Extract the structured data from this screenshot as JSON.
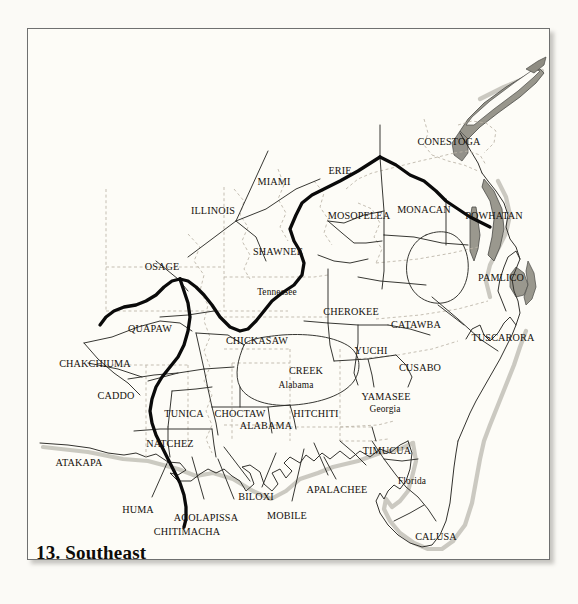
{
  "figure": {
    "title": "13. Southeast",
    "background_color": "#fdfcf7",
    "frame_color": "#6f7070",
    "text_color": "#15110c"
  },
  "map": {
    "region": "Southeast",
    "line_styles": {
      "culture_area_boundary": {
        "color": "#0a0a0a",
        "width": 3.2,
        "dash": "none"
      },
      "tribal_boundary": {
        "color": "#2b2b2b",
        "width": 0.9,
        "dash": "none"
      },
      "state_boundary": {
        "color": "#b9b2a4",
        "width": 0.8,
        "dash": "3,2.5"
      },
      "coastline": {
        "color": "#3a3a36",
        "width": 0.9
      },
      "coast_shadow": {
        "color": "#9a978c",
        "opacity": 0.55
      }
    },
    "tribe_labels": [
      {
        "name": "CONESTOGA",
        "x": 421,
        "y": 113
      },
      {
        "name": "ERIE",
        "x": 312,
        "y": 142
      },
      {
        "name": "MIAMI",
        "x": 246,
        "y": 153
      },
      {
        "name": "ILLINOIS",
        "x": 185,
        "y": 182
      },
      {
        "name": "MOSOPELEA",
        "x": 331,
        "y": 187
      },
      {
        "name": "MONACAN",
        "x": 396,
        "y": 181
      },
      {
        "name": "POWHATAN",
        "x": 466,
        "y": 187
      },
      {
        "name": "SHAWNEE",
        "x": 250,
        "y": 223
      },
      {
        "name": "OSAGE",
        "x": 134,
        "y": 238
      },
      {
        "name": "PAMLICO",
        "x": 473,
        "y": 249
      },
      {
        "name": "CHEROKEE",
        "x": 323,
        "y": 283
      },
      {
        "name": "QUAPAW",
        "x": 122,
        "y": 300
      },
      {
        "name": "CATAWBA",
        "x": 388,
        "y": 296
      },
      {
        "name": "CHICKASAW",
        "x": 229,
        "y": 312
      },
      {
        "name": "TUSCARORA",
        "x": 475,
        "y": 309
      },
      {
        "name": "YUCHI",
        "x": 343,
        "y": 322
      },
      {
        "name": "CHAKCHIUMA",
        "x": 67,
        "y": 335
      },
      {
        "name": "CUSABO",
        "x": 392,
        "y": 339
      },
      {
        "name": "CREEK",
        "x": 278,
        "y": 342
      },
      {
        "name": "CADDO",
        "x": 88,
        "y": 367
      },
      {
        "name": "YAMASEE",
        "x": 358,
        "y": 368
      },
      {
        "name": "TUNICA",
        "x": 156,
        "y": 385
      },
      {
        "name": "CHOCTAW",
        "x": 212,
        "y": 385
      },
      {
        "name": "HITCHITI",
        "x": 288,
        "y": 385
      },
      {
        "name": "ALABAMA",
        "x": 238,
        "y": 397
      },
      {
        "name": "NATCHEZ",
        "x": 142,
        "y": 415
      },
      {
        "name": "TIMUCUA",
        "x": 359,
        "y": 422
      },
      {
        "name": "ATAKAPA",
        "x": 51,
        "y": 434
      },
      {
        "name": "APALACHEE",
        "x": 309,
        "y": 461
      },
      {
        "name": "BILOXI",
        "x": 228,
        "y": 468
      },
      {
        "name": "HUMA",
        "x": 110,
        "y": 481
      },
      {
        "name": "MOBILE",
        "x": 259,
        "y": 487
      },
      {
        "name": "ACOLAPISSA",
        "x": 178,
        "y": 489
      },
      {
        "name": "CHITIMACHA",
        "x": 159,
        "y": 503
      },
      {
        "name": "CALUSA",
        "x": 408,
        "y": 508
      }
    ],
    "state_labels": [
      {
        "name": "Tennessee",
        "x": 249,
        "y": 264
      },
      {
        "name": "Alabama",
        "x": 268,
        "y": 357
      },
      {
        "name": "Georgia",
        "x": 357,
        "y": 381
      },
      {
        "name": "Florida",
        "x": 384,
        "y": 453
      }
    ]
  }
}
